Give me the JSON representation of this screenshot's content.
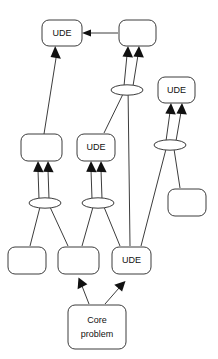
{
  "diagram": {
    "background_color": "#ffffff",
    "line_color": "#3c3c3c",
    "text_color": "#111111",
    "arrow_color": "#111111",
    "labels": {
      "ude": "UDE",
      "core_line1": "Core",
      "core_line2": "problem",
      "empty": ""
    },
    "nodes": [
      {
        "id": "ude-top-left",
        "label": "UDE",
        "x": 42,
        "y": 20,
        "w": 40,
        "h": 26
      },
      {
        "id": "box-top-right",
        "label": "",
        "x": 119,
        "y": 20,
        "w": 37,
        "h": 26
      },
      {
        "id": "ude-right",
        "label": "UDE",
        "x": 158,
        "y": 77,
        "w": 37,
        "h": 26
      },
      {
        "id": "box-mid-left",
        "label": "",
        "x": 21,
        "y": 134,
        "w": 41,
        "h": 27
      },
      {
        "id": "ude-mid-center",
        "label": "UDE",
        "x": 77,
        "y": 134,
        "w": 38,
        "h": 27
      },
      {
        "id": "box-mid-right",
        "label": "",
        "x": 168,
        "y": 189,
        "w": 38,
        "h": 27
      },
      {
        "id": "box-bottom-left",
        "label": "",
        "x": 8,
        "y": 247,
        "w": 38,
        "h": 27
      },
      {
        "id": "box-bottom-center",
        "label": "",
        "x": 58,
        "y": 247,
        "w": 41,
        "h": 27
      },
      {
        "id": "ude-bottom-right",
        "label": "UDE",
        "x": 112,
        "y": 247,
        "w": 39,
        "h": 27
      },
      {
        "id": "core-problem",
        "label": "Core problem",
        "x": 68,
        "y": 305,
        "w": 58,
        "h": 44
      }
    ],
    "connectors": [
      {
        "id": "and-upper-center",
        "cx": 127,
        "cy": 90,
        "rx": 16,
        "ry": 5
      },
      {
        "id": "and-right",
        "cx": 170,
        "cy": 145,
        "rx": 16,
        "ry": 5
      },
      {
        "id": "and-lower-left",
        "cx": 45,
        "cy": 203,
        "rx": 16,
        "ry": 5
      },
      {
        "id": "and-lower-center",
        "cx": 98,
        "cy": 203,
        "rx": 16,
        "ry": 5
      }
    ],
    "edges": [
      {
        "id": "edge-box-top-right-to-ude-top-left",
        "from": "box-top-right",
        "to": "ude-top-left",
        "arrow": true
      },
      {
        "id": "edge-box-mid-left-to-ude-top-left",
        "from": "box-mid-left",
        "to": "ude-top-left",
        "arrow": true
      },
      {
        "id": "edge-and-upper-center-to-box-top-right-a",
        "from": "and-upper-center",
        "to": "box-top-right",
        "arrow": true
      },
      {
        "id": "edge-and-upper-center-to-box-top-right-b",
        "from": "and-upper-center",
        "to": "box-top-right",
        "arrow": true
      },
      {
        "id": "edge-ude-mid-center-to-and-upper-center",
        "from": "ude-mid-center",
        "to": "and-upper-center",
        "arrow": false
      },
      {
        "id": "edge-ude-bottom-right-to-and-upper-center",
        "from": "ude-bottom-right",
        "to": "and-upper-center",
        "arrow": false
      },
      {
        "id": "edge-and-right-to-ude-right-a",
        "from": "and-right",
        "to": "ude-right",
        "arrow": true
      },
      {
        "id": "edge-and-right-to-ude-right-b",
        "from": "and-right",
        "to": "ude-right",
        "arrow": true
      },
      {
        "id": "edge-ude-bottom-right-to-and-right",
        "from": "ude-bottom-right",
        "to": "and-right",
        "arrow": false
      },
      {
        "id": "edge-box-mid-right-to-and-right",
        "from": "box-mid-right",
        "to": "and-right",
        "arrow": false
      },
      {
        "id": "edge-and-lower-left-to-box-mid-left-a",
        "from": "and-lower-left",
        "to": "box-mid-left",
        "arrow": true
      },
      {
        "id": "edge-and-lower-left-to-box-mid-left-b",
        "from": "and-lower-left",
        "to": "box-mid-left",
        "arrow": true
      },
      {
        "id": "edge-box-bottom-left-to-and-lower-left",
        "from": "box-bottom-left",
        "to": "and-lower-left",
        "arrow": false
      },
      {
        "id": "edge-box-bottom-center-to-and-lower-left",
        "from": "box-bottom-center",
        "to": "and-lower-left",
        "arrow": false
      },
      {
        "id": "edge-and-lower-center-to-ude-mid-center-a",
        "from": "and-lower-center",
        "to": "ude-mid-center",
        "arrow": true
      },
      {
        "id": "edge-and-lower-center-to-ude-mid-center-b",
        "from": "and-lower-center",
        "to": "ude-mid-center",
        "arrow": true
      },
      {
        "id": "edge-box-bottom-center-to-and-lower-center",
        "from": "box-bottom-center",
        "to": "and-lower-center",
        "arrow": false
      },
      {
        "id": "edge-ude-bottom-right-to-and-lower-center",
        "from": "ude-bottom-right",
        "to": "and-lower-center",
        "arrow": false
      },
      {
        "id": "edge-core-problem-to-box-bottom-center",
        "from": "core-problem",
        "to": "box-bottom-center",
        "arrow": true
      },
      {
        "id": "edge-core-problem-to-ude-bottom-right",
        "from": "core-problem",
        "to": "ude-bottom-right",
        "arrow": true
      }
    ]
  }
}
